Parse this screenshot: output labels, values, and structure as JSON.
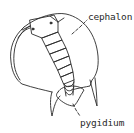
{
  "diagram": {
    "labels": {
      "cephalon": "cephalon",
      "pygidium": "pygidium"
    },
    "colors": {
      "line": "#2a2a2a",
      "background": "#ffffff"
    }
  }
}
